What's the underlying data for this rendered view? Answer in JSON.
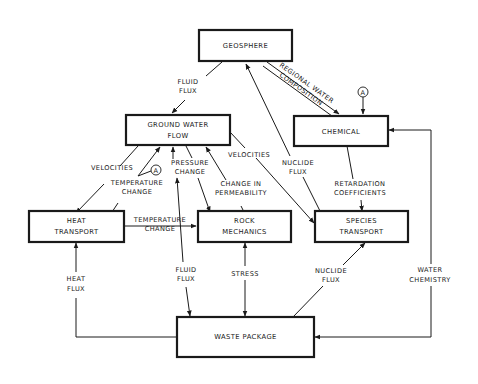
{
  "diagram": {
    "nodes": {
      "geosphere": {
        "label": "GEOSPHERE"
      },
      "ground_water_flow": {
        "line1": "GROUND WATER",
        "line2": "FLOW"
      },
      "chemical": {
        "label": "CHEMICAL"
      },
      "heat_transport": {
        "line1": "HEAT",
        "line2": "TRANSPORT"
      },
      "rock_mechanics": {
        "line1": "ROCK",
        "line2": "MECHANICS"
      },
      "species_transport": {
        "line1": "SPECIES",
        "line2": "TRANSPORT"
      },
      "waste_package": {
        "label": "WASTE PACKAGE"
      }
    },
    "edges": {
      "fluid_flux_top": {
        "line1": "FLUID",
        "line2": "FLUX"
      },
      "regional_water_composition": {
        "line1": "REGIONAL WATER",
        "line2": "COMPOSITION"
      },
      "velocities_left": {
        "label": "VELOCITIES"
      },
      "temperature_change_up": {
        "line1": "TEMPERATURE",
        "line2": "CHANGE"
      },
      "pressure_change": {
        "line1": "PRESSURE",
        "line2": "CHANGE"
      },
      "change_in_permeability": {
        "line1": "CHANGE IN",
        "line2": "PERMEABILITY"
      },
      "velocities_right": {
        "label": "VELOCITIES"
      },
      "nuclide_flux_top": {
        "line1": "NUCLIDE",
        "line2": "FLUX"
      },
      "retardation_coefficients": {
        "line1": "RETARDATION",
        "line2": "COEFFICIENTS"
      },
      "temperature_change_horiz": {
        "line1": "TEMPERATURE",
        "line2": "CHANGE"
      },
      "heat_flux": {
        "line1": "HEAT",
        "line2": "FLUX"
      },
      "fluid_flux_bottom": {
        "line1": "FLUID",
        "line2": "FLUX"
      },
      "stress": {
        "label": "STRESS"
      },
      "nuclide_flux_bottom": {
        "line1": "NUCLIDE",
        "line2": "FLUX"
      },
      "water_chemistry": {
        "line1": "WATER",
        "line2": "CHEMISTRY"
      }
    },
    "connectors": {
      "marker_a": "A"
    }
  }
}
